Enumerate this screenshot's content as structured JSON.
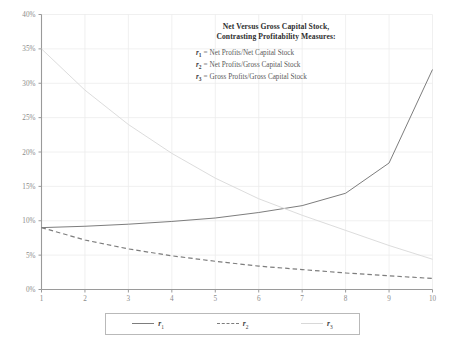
{
  "chart_data": {
    "type": "line",
    "title": "Net Versus Gross Capital Stock, Contrasting Profitability Measures:",
    "title_line1": "Net Versus Gross Capital Stock,",
    "title_line2": "Contrasting Profitability Measures:",
    "xlabel": "",
    "ylabel": "",
    "xlim": [
      1,
      10
    ],
    "ylim": [
      0,
      40
    ],
    "grid": true,
    "legend_position": "bottom",
    "x": [
      1,
      2,
      3,
      4,
      5,
      6,
      7,
      8,
      9,
      10
    ],
    "xticklabels": [
      "1",
      "2",
      "3",
      "4",
      "5",
      "6",
      "7",
      "8",
      "9",
      "10"
    ],
    "yticks": [
      0,
      5,
      10,
      15,
      20,
      25,
      30,
      35,
      40
    ],
    "yticklabels": [
      "0%",
      "5%",
      "10%",
      "15%",
      "20%",
      "25%",
      "30%",
      "35%",
      "40%"
    ],
    "series": [
      {
        "name": "r1",
        "label": "r1",
        "style": "solid",
        "color": "#7d7d7d",
        "definition": "Net Profits/Net Capital Stock",
        "values": [
          9.0,
          9.2,
          9.5,
          9.9,
          10.4,
          11.2,
          12.2,
          14.0,
          18.4,
          32.0
        ]
      },
      {
        "name": "r2",
        "label": "r2",
        "style": "dashed",
        "color": "#7d7d7d",
        "definition": "Net Profits/Gross Capital Stock",
        "values": [
          9.0,
          7.2,
          5.9,
          4.9,
          4.1,
          3.4,
          2.9,
          2.4,
          2.0,
          1.6
        ]
      },
      {
        "name": "r3",
        "label": "r3",
        "style": "light",
        "color": "#d8d8d8",
        "definition": "Gross Profits/Gross Capital Stock",
        "values": [
          35.0,
          29.0,
          24.0,
          19.8,
          16.2,
          13.2,
          10.8,
          8.6,
          6.4,
          4.4
        ]
      }
    ],
    "legend_entries": [
      {
        "label": "r",
        "sub": "1",
        "style": "solid"
      },
      {
        "label": "r",
        "sub": "2",
        "style": "dashed"
      },
      {
        "label": "r",
        "sub": "3",
        "style": "light"
      }
    ],
    "definitions": [
      {
        "sym": "r",
        "sub": "1",
        "eq": "=",
        "text": "Net Profits/Net Capital Stock"
      },
      {
        "sym": "r",
        "sub": "2",
        "eq": "=",
        "text": "Net Profits/Gross Capital Stock"
      },
      {
        "sym": "r",
        "sub": "3",
        "eq": "=",
        "text": "Gross Profits/Gross Capital Stock"
      }
    ],
    "colors": {
      "axis": "#9a9a9a",
      "grid": "#ececec",
      "series_dark": "#7d7d7d",
      "series_light": "#d8d8d8",
      "text": "#5a5a5a",
      "background": "#ffffff"
    }
  }
}
